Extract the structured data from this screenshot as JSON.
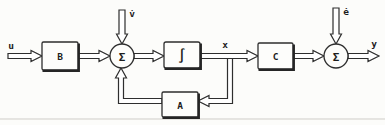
{
  "figure": {
    "kind": "state-space block diagram",
    "ink_color": "#2e2e2e",
    "background_color": "#fcfcfa",
    "blocks": {
      "b": "B",
      "integrator": "∫",
      "c": "C",
      "a": "A"
    },
    "junctions": {
      "sum1": "Σ",
      "sum2": "Σ"
    },
    "signals": {
      "input": "u",
      "process_noise": "v̇",
      "state": "x",
      "measurement_noise": "ė",
      "output": "y"
    }
  }
}
